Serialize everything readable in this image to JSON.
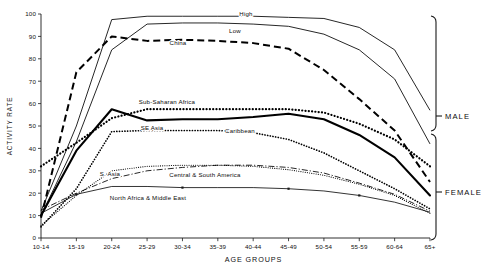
{
  "chart_data": {
    "type": "line",
    "title": "",
    "xlabel": "AGE GROUPS",
    "ylabel": "ACTIVITY RATE",
    "categories": [
      "10-14",
      "15-19",
      "20-24",
      "25-29",
      "30-34",
      "35-39",
      "40-44",
      "45-49",
      "50-54",
      "55-59",
      "60-64",
      "65+"
    ],
    "xlim": [
      0,
      11
    ],
    "ylim": [
      0,
      100
    ],
    "ytick_values": [
      0,
      10,
      20,
      30,
      40,
      50,
      60,
      70,
      80,
      90,
      100
    ],
    "ytick_labels": [
      "0",
      "10",
      "20",
      "30",
      "40",
      "50",
      "60",
      "70",
      "80",
      "90",
      "100"
    ],
    "grid": false,
    "legend": "inline-annotations",
    "group_brackets": [
      {
        "label": "MALE",
        "from_category": "",
        "to_category": ""
      },
      {
        "label": "FEMALE",
        "from_category": "",
        "to_category": ""
      }
    ],
    "series": [
      {
        "name": "High",
        "group": "MALE",
        "style": "thin-solid",
        "label": "High",
        "values": [
          12,
          50,
          97.5,
          99,
          99,
          99,
          99,
          98.5,
          98,
          94,
          84,
          57
        ]
      },
      {
        "name": "Low",
        "group": "MALE",
        "style": "thin-solid",
        "label": "Low",
        "values": [
          10,
          43,
          84,
          95.5,
          96,
          96,
          95.5,
          94.5,
          91,
          84,
          71,
          42
        ]
      },
      {
        "name": "China",
        "group": "MALE",
        "style": "dashed",
        "label": "China",
        "values": [
          9,
          74,
          90,
          88,
          88.5,
          88,
          87,
          84.5,
          75,
          62,
          48,
          25
        ]
      },
      {
        "name": "Sub-Saharan Africa",
        "group": "FEMALE",
        "style": "dotted-thick",
        "label": "Sub-Saharan Africa",
        "values": [
          32,
          42.5,
          53.5,
          57.5,
          57.5,
          57.5,
          57.5,
          57.5,
          56,
          51,
          44,
          32
        ]
      },
      {
        "name": "SE Asia",
        "group": "FEMALE",
        "style": "thick-solid",
        "label": "SE Asia",
        "values": [
          10,
          39,
          57.5,
          52.5,
          53,
          53,
          54,
          55.5,
          53,
          46,
          36,
          19
        ]
      },
      {
        "name": "Caribbean",
        "group": "FEMALE",
        "style": "dotted-medium",
        "label": "Caribbean",
        "values": [
          5,
          22,
          47.5,
          48,
          48,
          48,
          47,
          44,
          38,
          30,
          22,
          13
        ]
      },
      {
        "name": "Central & South America",
        "group": "FEMALE",
        "style": "dash-dot",
        "label": "Central & South America",
        "values": [
          12.5,
          20,
          26.5,
          30,
          31.5,
          32.5,
          32.5,
          31.5,
          29,
          24.5,
          19.5,
          12
        ]
      },
      {
        "name": "S. Asia",
        "group": "FEMALE",
        "style": "dotted-fine",
        "label": "S. Asia",
        "values": [
          5.5,
          19,
          30,
          32,
          32.5,
          32.5,
          32,
          30.5,
          28,
          24,
          19,
          11
        ]
      },
      {
        "name": "North Africa & Middle East",
        "group": "FEMALE",
        "style": "thin-solid-marked",
        "label": "North Africa & Middle East",
        "values": [
          11,
          19.5,
          23,
          23,
          22.5,
          22.5,
          22.5,
          22,
          21,
          19,
          16,
          11.5
        ]
      }
    ],
    "annotations": [
      {
        "text": "High",
        "x_px": 246,
        "y_px": 16
      },
      {
        "text": "Low",
        "x_px": 235,
        "y_px": 33
      },
      {
        "text": "China",
        "x_px": 178,
        "y_px": 45
      },
      {
        "text": "Sub-Saharan Africa",
        "x_px": 167,
        "y_px": 104
      },
      {
        "text": "SE Asia",
        "x_px": 152,
        "y_px": 130
      },
      {
        "text": "Caribbean",
        "x_px": 240,
        "y_px": 133
      },
      {
        "text": "Central & South America",
        "x_px": 205,
        "y_px": 177
      },
      {
        "text": "S. Asia",
        "x_px": 110,
        "y_px": 176
      },
      {
        "text": "North Africa & Middle East",
        "x_px": 148,
        "y_px": 200
      }
    ],
    "colors": {
      "axis": "#1a1a1a",
      "thin_line": "#555555",
      "thick_line": "#000000",
      "background": "#ffffff"
    }
  }
}
